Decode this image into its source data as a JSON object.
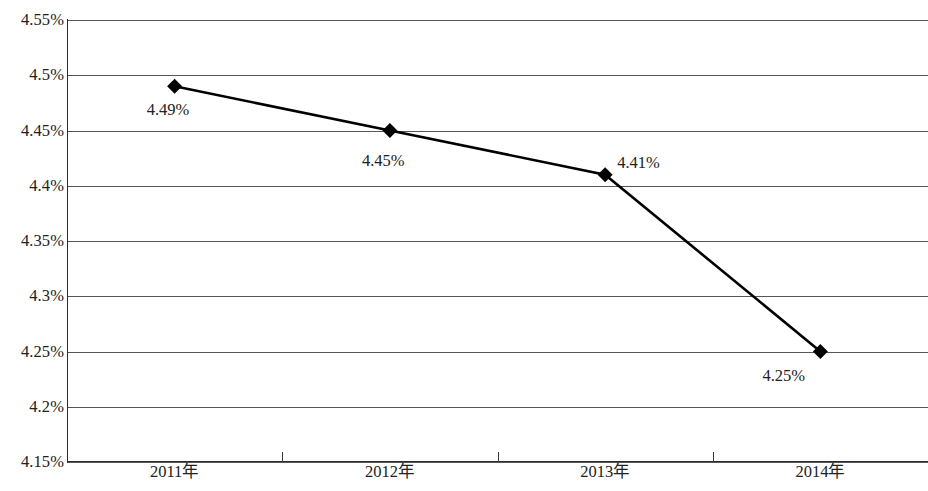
{
  "chart_data": {
    "type": "line",
    "title": "",
    "subtitle": "",
    "xlabel": "",
    "ylabel": "",
    "categories": [
      "2011年",
      "2012年",
      "2013年",
      "2014年"
    ],
    "values": [
      4.49,
      4.45,
      4.41,
      4.25
    ],
    "point_labels": [
      "4.49%",
      "4.45%",
      "4.41%",
      "4.25%"
    ],
    "ylim": [
      4.15,
      4.55
    ],
    "ytick_step": 0.05,
    "ytick_labels": [
      "4.55%",
      "4.5%",
      "4.45%",
      "4.4%",
      "4.35%",
      "4.3%",
      "4.25%",
      "4.2%",
      "4.15%"
    ],
    "ytick_values": [
      4.55,
      4.5,
      4.45,
      4.4,
      4.35,
      4.3,
      4.25,
      4.2,
      4.15
    ],
    "grid": true,
    "legend": false,
    "legend_position": "none",
    "series": [
      {
        "name": "",
        "values": [
          4.49,
          4.45,
          4.41,
          4.25
        ],
        "marker": "diamond",
        "line_color": "#000000",
        "marker_color": "#000000"
      }
    ],
    "unit": "%"
  },
  "axes": {
    "y_labels": [
      {
        "text": "4.55%",
        "value": 4.55
      },
      {
        "text": "4.5%",
        "value": 4.5
      },
      {
        "text": "4.45%",
        "value": 4.45
      },
      {
        "text": "4.4%",
        "value": 4.4
      },
      {
        "text": "4.35%",
        "value": 4.35
      },
      {
        "text": "4.3%",
        "value": 4.3
      },
      {
        "text": "4.25%",
        "value": 4.25
      },
      {
        "text": "4.2%",
        "value": 4.2
      },
      {
        "text": "4.15%",
        "value": 4.15
      }
    ],
    "x_labels": [
      {
        "text": "2011年"
      },
      {
        "text": "2012年"
      },
      {
        "text": "2013年"
      },
      {
        "text": "2014年"
      }
    ]
  },
  "points": [
    {
      "label": "4.49%",
      "category": "2011年",
      "value": 4.49
    },
    {
      "label": "4.45%",
      "category": "2012年",
      "value": 4.45
    },
    {
      "label": "4.41%",
      "category": "2013年",
      "value": 4.41
    },
    {
      "label": "4.25%",
      "category": "2014年",
      "value": 4.25
    }
  ],
  "colors": {
    "line": "#000000",
    "marker": "#000000",
    "grid": "#555555",
    "axis": "#2b2b2b",
    "text": "#222222",
    "background": "#ffffff"
  }
}
